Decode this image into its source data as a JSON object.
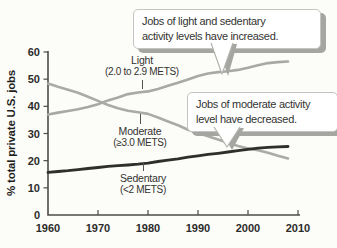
{
  "figure": {
    "background": "#fcfcf9"
  },
  "colors": {
    "axis": "#4b4b48",
    "line_gray": "#a8a8a5",
    "line_dark": "#2e2e2c",
    "text": "#2f2f2d",
    "callout_border": "#c4c4c0",
    "callout_shadow": "#a5a5a1"
  },
  "callouts": [
    {
      "id": "increase",
      "line1": "Jobs of light and sedentary",
      "line2": "activity levels have increased."
    },
    {
      "id": "decrease",
      "line1": "Jobs of moderate activity",
      "line2": "level have decreased."
    }
  ],
  "series_labels": [
    {
      "name": "Light",
      "detail": "(2.0 to 2.9 METS)"
    },
    {
      "name": "Moderate",
      "detail": "(≥3.0 METS)"
    },
    {
      "name": "Sedentary",
      "detail": "(<2 METS)"
    }
  ],
  "chart_data": {
    "type": "line",
    "title": "",
    "xlabel": "",
    "ylabel": "% total private U.S. jobs",
    "xlim": [
      1960,
      2010
    ],
    "ylim": [
      0,
      60
    ],
    "x_ticks": [
      1960,
      1970,
      1980,
      1990,
      2000,
      2010
    ],
    "y_ticks": [
      0,
      10,
      20,
      30,
      40,
      50,
      60
    ],
    "grid": false,
    "legend_position": "inline-labels",
    "x": [
      1960,
      1962,
      1964,
      1966,
      1968,
      1970,
      1972,
      1974,
      1976,
      1978,
      1980,
      1982,
      1984,
      1986,
      1988,
      1990,
      1992,
      1994,
      1996,
      1998,
      2000,
      2002,
      2004,
      2006,
      2008
    ],
    "series": [
      {
        "key": "light",
        "name": "Light (2.0 to 2.9 METS)",
        "color": "#a8a8a5",
        "width": 2.6,
        "values": [
          37.0,
          37.7,
          38.3,
          38.9,
          39.8,
          40.8,
          42.2,
          43.3,
          44.5,
          45.1,
          45.5,
          46.4,
          47.6,
          48.7,
          49.9,
          51.2,
          52.1,
          52.6,
          52.9,
          53.4,
          54.2,
          55.1,
          55.9,
          56.3,
          56.5
        ]
      },
      {
        "key": "moderate",
        "name": "Moderate (≥3.0 METS)",
        "color": "#abaaa7",
        "width": 2.6,
        "values": [
          48.4,
          47.2,
          46.1,
          45.0,
          43.5,
          42.0,
          40.5,
          39.3,
          38.4,
          37.8,
          37.2,
          35.9,
          34.4,
          33.0,
          31.4,
          30.2,
          29.0,
          27.8,
          26.6,
          25.4,
          24.5,
          23.8,
          22.9,
          21.8,
          20.8
        ]
      },
      {
        "key": "sedentary",
        "name": "Sedentary (<2 METS)",
        "color": "#2e2e2c",
        "width": 2.8,
        "values": [
          15.7,
          16.0,
          16.3,
          16.7,
          17.1,
          17.5,
          17.9,
          18.2,
          18.4,
          18.7,
          19.1,
          19.7,
          20.2,
          20.7,
          21.3,
          21.8,
          22.3,
          22.7,
          23.2,
          23.7,
          24.2,
          24.6,
          24.9,
          25.1,
          25.2
        ]
      }
    ]
  }
}
